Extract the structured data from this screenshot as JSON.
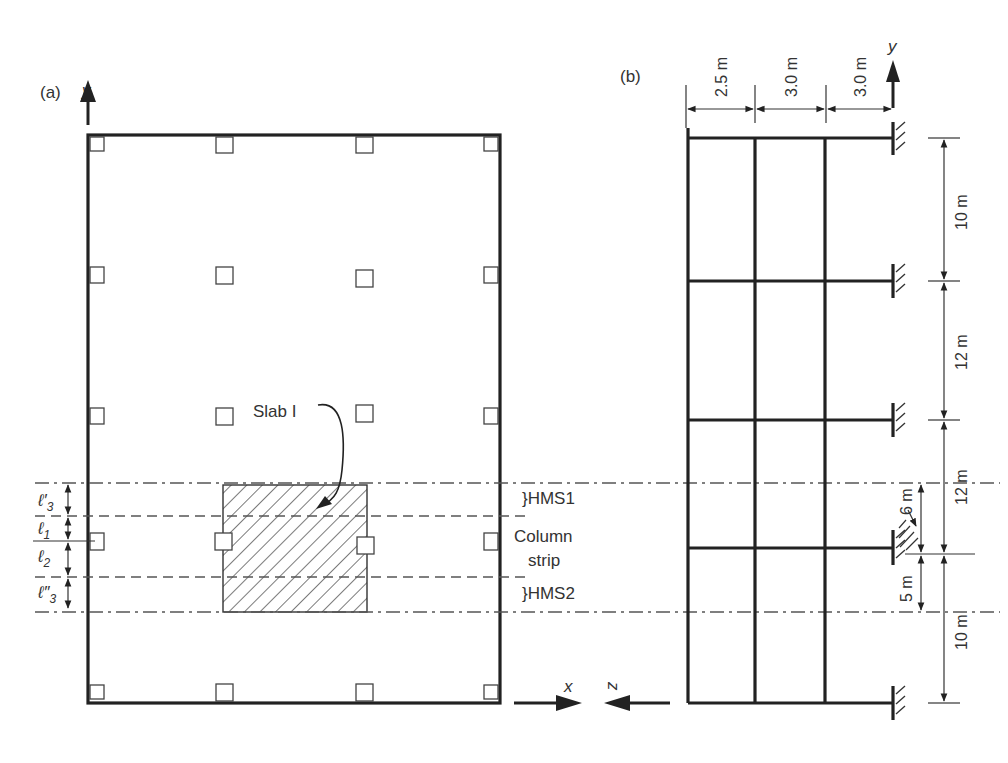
{
  "panel_a": {
    "label": "(a)",
    "y_axis_label": "y",
    "x_axis_label": "x",
    "slab_label": "Slab I",
    "strip_labels": {
      "hms1": "}HMS1",
      "column_strip_line1": "Column",
      "column_strip_line2": "strip",
      "hms2": "}HMS2"
    },
    "dimension_labels": [
      {
        "symbol": "ℓ",
        "sub": "3",
        "prime": "′"
      },
      {
        "symbol": "ℓ",
        "sub": "1",
        "prime": ""
      },
      {
        "symbol": "ℓ",
        "sub": "2",
        "prime": ""
      },
      {
        "symbol": "ℓ",
        "sub": "3",
        "prime": "″"
      }
    ]
  },
  "panel_b": {
    "label": "(b)",
    "y_axis_label": "y",
    "z_axis_label": "z",
    "horizontal_spans": [
      "2.5 m",
      "3.0 m",
      "3.0 m"
    ],
    "vertical_spans": [
      "10 m",
      "12 m",
      "12 m",
      "10 m"
    ],
    "strip_spans": [
      "6 m",
      "5 m"
    ]
  }
}
